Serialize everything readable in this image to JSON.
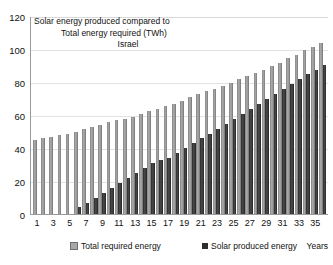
{
  "chart_data": {
    "type": "bar",
    "title": "Solar energy produced compared to Total energy required (TWh) Israel",
    "title_lines": [
      "Solar energy produced compared to",
      "Total energy required (TWh)",
      "Israel"
    ],
    "xlabel": "Years",
    "ylabel": "",
    "ylim": [
      0,
      120
    ],
    "yticks": [
      0,
      20,
      40,
      60,
      80,
      100,
      120
    ],
    "grid": true,
    "legend_position": "bottom",
    "categories": [
      1,
      2,
      3,
      4,
      5,
      6,
      7,
      8,
      9,
      10,
      11,
      12,
      13,
      14,
      15,
      16,
      17,
      18,
      19,
      20,
      21,
      22,
      23,
      24,
      25,
      26,
      27,
      28,
      29,
      30,
      31,
      32,
      33,
      34,
      35,
      36
    ],
    "xtick_labels": [
      "1",
      "",
      "3",
      "",
      "5",
      "",
      "7",
      "",
      "9",
      "",
      "11",
      "",
      "13",
      "",
      "15",
      "",
      "17",
      "",
      "19",
      "",
      "21",
      "",
      "23",
      "",
      "25",
      "",
      "27",
      "",
      "29",
      "",
      "31",
      "",
      "33",
      "",
      "35",
      ""
    ],
    "series": [
      {
        "name": "Total required energy",
        "color": "#9a9a9a",
        "values": [
          45,
          46,
          47,
          48,
          49,
          50,
          52,
          53,
          54,
          56,
          57,
          58,
          59,
          61,
          63,
          64,
          66,
          67,
          69,
          71,
          73,
          75,
          76,
          78,
          80,
          82,
          84,
          86,
          88,
          90,
          92,
          95,
          97,
          100,
          102,
          104
        ]
      },
      {
        "name": "Solar produced energy",
        "color": "#2e2e2e",
        "values": [
          0,
          0,
          0,
          0,
          0,
          4,
          7,
          10,
          13,
          16,
          19,
          22,
          25,
          28,
          31,
          33,
          34,
          37,
          40,
          43,
          46,
          49,
          52,
          55,
          58,
          61,
          64,
          67,
          70,
          73,
          76,
          79,
          82,
          85,
          88,
          91
        ]
      }
    ]
  }
}
